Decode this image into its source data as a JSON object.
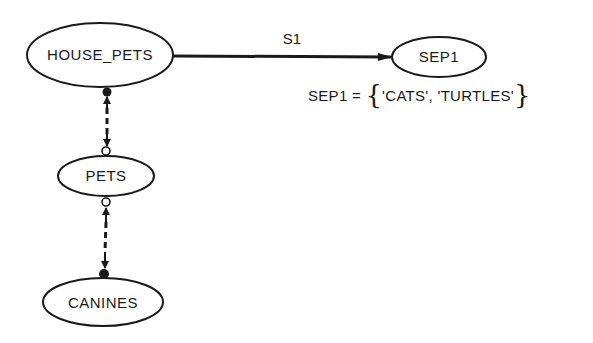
{
  "diagram": {
    "type": "semantic-data-model",
    "colors": {
      "stroke": "#1a1a1a",
      "background": "#ffffff"
    },
    "nodes": [
      {
        "id": "house_pets",
        "label": "HOUSE_PETS"
      },
      {
        "id": "sep1",
        "label": "SEP1"
      },
      {
        "id": "pets",
        "label": "PETS"
      },
      {
        "id": "canines",
        "label": "CANINES"
      }
    ],
    "edges": [
      {
        "from": "HOUSE_PETS",
        "to": "SEP1",
        "label": "S1",
        "style": "solid-arrow"
      },
      {
        "from": "HOUSE_PETS",
        "to": "PETS",
        "label": "",
        "style": "dashed-double-arrow",
        "end_markers": [
          "filled-dot",
          "hollow-circle"
        ]
      },
      {
        "from": "PETS",
        "to": "CANINES",
        "label": "",
        "style": "dashed-double-arrow",
        "end_markers": [
          "hollow-circle",
          "filled-dot"
        ]
      }
    ],
    "annotation": {
      "lhs": "SEP1 = ",
      "brace_open": "{",
      "values": "'CATS', 'TURTLES'",
      "brace_close": "}"
    }
  }
}
